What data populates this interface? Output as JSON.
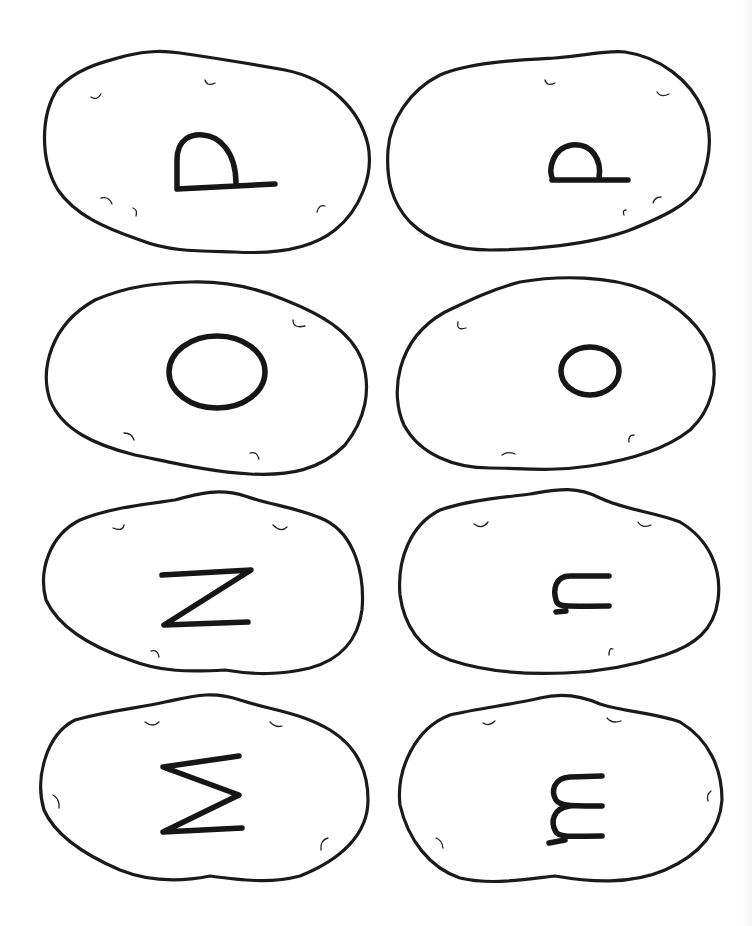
{
  "worksheet": {
    "title": "Potato letter cards",
    "cards": [
      {
        "id": "card-1",
        "letter": "D",
        "case": "uppercase",
        "rotation": "rotated 90deg (drawn as arch on baseline)",
        "position": "row 1, left"
      },
      {
        "id": "card-2",
        "letter": "d",
        "case": "lowercase",
        "rotation": "rotated 90deg",
        "position": "row 1, right"
      },
      {
        "id": "card-3",
        "letter": "O",
        "case": "uppercase",
        "rotation": "none",
        "position": "row 2, left"
      },
      {
        "id": "card-4",
        "letter": "o",
        "case": "lowercase",
        "rotation": "none",
        "position": "row 2, right"
      },
      {
        "id": "card-5",
        "letter": "N",
        "case": "uppercase",
        "rotation": "rotated 90deg (appears as Z)",
        "position": "row 3, left"
      },
      {
        "id": "card-6",
        "letter": "n",
        "case": "lowercase",
        "rotation": "rotated 90deg",
        "position": "row 3, right"
      },
      {
        "id": "card-7",
        "letter": "M",
        "case": "uppercase",
        "rotation": "rotated 90deg (appears as sigma)",
        "position": "row 4, left"
      },
      {
        "id": "card-8",
        "letter": "m",
        "case": "lowercase",
        "rotation": "rotated 90deg",
        "position": "row 4, right"
      }
    ],
    "colors": {
      "outline": "#1a1a1a",
      "background": "#ffffff"
    }
  }
}
